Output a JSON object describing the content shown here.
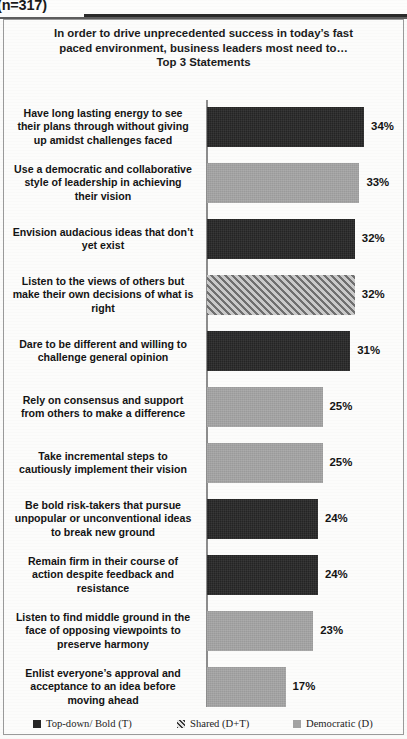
{
  "header": {
    "sample_size": "(n=317)"
  },
  "chart_data": {
    "type": "bar",
    "orientation": "horizontal",
    "title_lines": [
      "In order to drive unprecedented success in today’s fast",
      "paced environment, business leaders most need to…",
      "Top 3 Statements"
    ],
    "xlabel": "",
    "ylabel": "",
    "xlim": [
      0,
      40
    ],
    "grid": false,
    "legend_position": "bottom",
    "categories": [
      "Have long lasting energy to see their plans through without giving up amidst challenges faced",
      "Use a democratic and collaborative style of leadership  in achieving their vision",
      "Envision audacious ideas that don’t yet exist",
      "Listen to the views of others but make their own decisions of what is right",
      "Dare to be different and willing to challenge  general opinion",
      "Rely on consensus and support from others to make a difference",
      "Take incremental steps to cautiously implement their vision",
      "Be bold risk-takers  that pursue unpopular or unconventional ideas to break new ground",
      "Remain firm in their course of action despite feedback and resistance",
      "Listen to find middle ground in the face of opposing viewpoints  to preserve harmony",
      "Enlist everyone’s approval and acceptance to an idea before moving ahead"
    ],
    "values": [
      34,
      33,
      32,
      32,
      31,
      25,
      25,
      24,
      24,
      23,
      17
    ],
    "value_labels": [
      "34%",
      "33%",
      "32%",
      "32%",
      "31%",
      "25%",
      "25%",
      "24%",
      "24%",
      "23%",
      "17%"
    ],
    "bar_styles": [
      "dark",
      "gray",
      "dark",
      "hatch",
      "dark",
      "gray",
      "gray",
      "dark",
      "dark",
      "gray",
      "gray"
    ],
    "series_map": {
      "dark": "Top-down/ Bold (T)",
      "gray": "Democratic (D)",
      "hatch": "Shared (D+T)"
    },
    "legend": [
      {
        "label": "Top-down/ Bold (T)",
        "style": "dark"
      },
      {
        "label": "Shared (D+T)",
        "style": "hatch"
      },
      {
        "label": "Democratic (D)",
        "style": "gray"
      }
    ],
    "colors": {
      "dark": "#242424",
      "gray": "#9a9a9a",
      "hatch": "#b4b4b4",
      "axis": "#8d8d8d",
      "text": "#141414",
      "background": "#fcfcfb"
    }
  },
  "category_label_lines": [
    [
      "Have long lasting energy to see",
      "their plans through without giving",
      "up amidst challenges faced"
    ],
    [
      "Use a democratic and collaborative",
      "style of leadership  in achieving",
      "their vision"
    ],
    [
      "Envision audacious ideas that don’t",
      "yet exist"
    ],
    [
      "Listen to the views of others but",
      "make their own decisions of what is",
      "right"
    ],
    [
      "Dare to be different and willing to",
      "challenge  general opinion"
    ],
    [
      "Rely on consensus and support",
      "from others to make a difference"
    ],
    [
      "Take incremental steps to",
      "cautiously implement their vision"
    ],
    [
      "Be bold risk-takers  that pursue",
      "unpopular or unconventional ideas",
      "to break new ground"
    ],
    [
      "Remain firm in their course of",
      "action despite feedback and",
      "resistance"
    ],
    [
      "Listen to find middle ground in the",
      "face of opposing viewpoints  to",
      "preserve harmony"
    ],
    [
      "Enlist everyone’s approval and",
      "acceptance to an idea before",
      "moving ahead"
    ]
  ]
}
